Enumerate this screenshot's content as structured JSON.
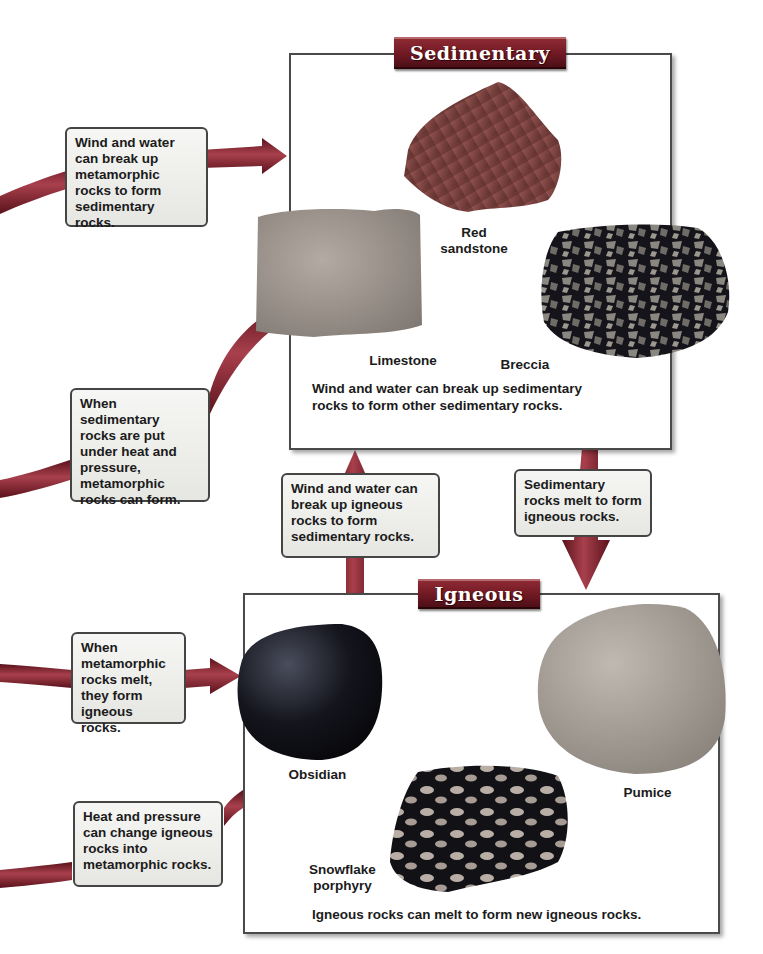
{
  "colors": {
    "banner": "#6e1822",
    "arrow": "#7a1f2b",
    "arrow_highlight": "#a8404c",
    "box_border": "#4a4a4a",
    "caption_fill": "#eeeeea"
  },
  "sedimentary": {
    "title": "Sedimentary",
    "rocks": [
      {
        "name": "red-sandstone",
        "label_line1": "Red",
        "label_line2": "sandstone"
      },
      {
        "name": "limestone",
        "label": "Limestone"
      },
      {
        "name": "breccia",
        "label": "Breccia"
      }
    ],
    "note_line1": "Wind and water can break up sedimentary",
    "note_line2": "rocks to form other sedimentary rocks."
  },
  "igneous": {
    "title": "Igneous",
    "rocks": [
      {
        "name": "obsidian",
        "label": "Obsidian"
      },
      {
        "name": "pumice",
        "label": "Pumice"
      },
      {
        "name": "snowflake-porphyry",
        "label_line1": "Snowflake",
        "label_line2": "porphyry"
      }
    ],
    "note": "Igneous rocks can melt to form new igneous rocks."
  },
  "captions": {
    "metamorphic_to_sedimentary": [
      "Wind and water",
      "can break up",
      "metamorphic",
      "rocks to form",
      "sedimentary rocks."
    ],
    "sedimentary_to_metamorphic": [
      "When sedimentary",
      "rocks are put",
      "under heat and",
      "pressure,",
      "metamorphic",
      "rocks can form."
    ],
    "igneous_to_sedimentary": [
      "Wind and water can",
      "break up igneous",
      "rocks to form",
      "sedimentary rocks."
    ],
    "sedimentary_to_igneous": [
      "Sedimentary",
      "rocks melt to form",
      "igneous rocks."
    ],
    "metamorphic_to_igneous": [
      "When",
      "metamorphic",
      "rocks melt,",
      "they form",
      "igneous rocks."
    ],
    "igneous_to_metamorphic": [
      "Heat and pressure",
      "can change igneous",
      "rocks into",
      "metamorphic rocks."
    ]
  }
}
